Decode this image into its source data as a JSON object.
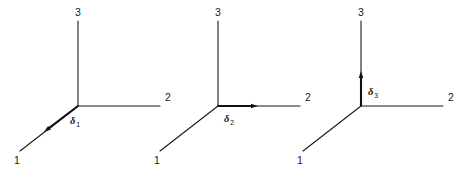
{
  "figure": {
    "background_color": "#ffffff",
    "line_color": "#1a1a1a",
    "arrow_color": "#111111",
    "triads": [
      {
        "id": "triad-1",
        "origin": {
          "x": 78,
          "y": 106
        },
        "axes": [
          {
            "name": "axis-1",
            "label": "1",
            "end": {
              "x": 20,
              "y": 151
            },
            "label_pos": {
              "x": 14,
              "y": 164
            }
          },
          {
            "name": "axis-2",
            "label": "2",
            "end": {
              "x": 160,
              "y": 106
            },
            "label_pos": {
              "x": 165,
              "y": 101
            }
          },
          {
            "name": "axis-3",
            "label": "3",
            "end": {
              "x": 78,
              "y": 21
            },
            "label_pos": {
              "x": 75,
              "y": 16
            }
          }
        ],
        "vector": {
          "name": "delta-1",
          "symbol": "δ",
          "subscript": "1",
          "direction": "axis-1",
          "tip": {
            "x": 44,
            "y": 132
          },
          "label_pos": {
            "x": 70,
            "y": 124
          }
        }
      },
      {
        "id": "triad-2",
        "origin": {
          "x": 218,
          "y": 106
        },
        "axes": [
          {
            "name": "axis-1",
            "label": "1",
            "end": {
              "x": 160,
              "y": 151
            },
            "label_pos": {
              "x": 154,
              "y": 164
            }
          },
          {
            "name": "axis-2",
            "label": "2",
            "end": {
              "x": 300,
              "y": 106
            },
            "label_pos": {
              "x": 305,
              "y": 101
            }
          },
          {
            "name": "axis-3",
            "label": "3",
            "end": {
              "x": 218,
              "y": 21
            },
            "label_pos": {
              "x": 215,
              "y": 16
            }
          }
        ],
        "vector": {
          "name": "delta-2",
          "symbol": "δ",
          "subscript": "2",
          "direction": "axis-2",
          "tip": {
            "x": 258,
            "y": 106
          },
          "label_pos": {
            "x": 224,
            "y": 122
          }
        }
      },
      {
        "id": "triad-3",
        "origin": {
          "x": 361,
          "y": 106
        },
        "axes": [
          {
            "name": "axis-1",
            "label": "1",
            "end": {
              "x": 303,
              "y": 151
            },
            "label_pos": {
              "x": 297,
              "y": 164
            }
          },
          {
            "name": "axis-2",
            "label": "2",
            "end": {
              "x": 443,
              "y": 106
            },
            "label_pos": {
              "x": 448,
              "y": 101
            }
          },
          {
            "name": "axis-3",
            "label": "3",
            "end": {
              "x": 361,
              "y": 21
            },
            "label_pos": {
              "x": 358,
              "y": 16
            }
          }
        ],
        "vector": {
          "name": "delta-3",
          "symbol": "δ",
          "subscript": "3",
          "direction": "axis-3",
          "tip": {
            "x": 361,
            "y": 71
          },
          "label_pos": {
            "x": 368,
            "y": 95
          }
        }
      }
    ]
  }
}
